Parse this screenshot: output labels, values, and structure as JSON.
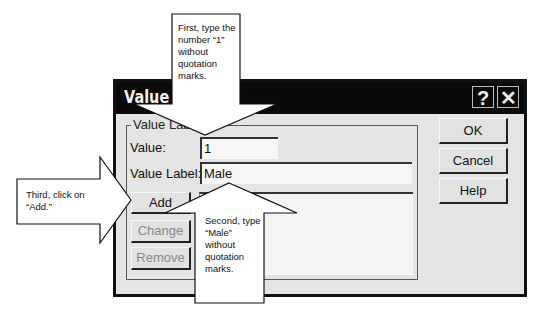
{
  "dialog": {
    "title": "Value L",
    "title_buttons": {
      "help": "?",
      "close": "✕"
    },
    "group_label": "Value Lab",
    "value_label": "Value:",
    "value_input": "1",
    "value_label_label": "Value Label:",
    "value_label_input": "Male",
    "buttons": {
      "add": "Add",
      "change": "Change",
      "remove": "Remove",
      "ok": "OK",
      "cancel": "Cancel",
      "help": "Help"
    }
  },
  "callouts": {
    "first": "First, type the number “1” without quotation marks.",
    "second": "Second, type “Male” without quotation marks.",
    "third": "Third, click on “Add.”"
  },
  "icons": {
    "help": "question-mark",
    "close": "x-mark"
  }
}
